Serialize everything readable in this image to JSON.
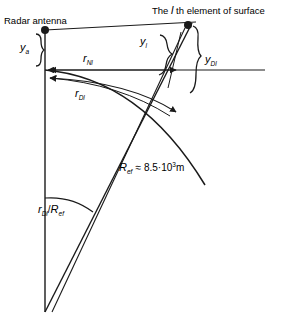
{
  "figure": {
    "type": "technical-geometry-diagram",
    "domain": "radar-propagation-earth-curvature",
    "background_color": "#ffffff",
    "stroke_color": "#1a1a1a",
    "width": 297,
    "height": 327
  },
  "labels": {
    "antenna_title": "Radar antenna",
    "element_title_prefix": "The ",
    "element_title_italic": "l",
    "element_title_suffix": " th element of surface",
    "antenna_height": {
      "base": "y",
      "subscript": "a"
    },
    "element_height": {
      "base": "y",
      "subscript": "l"
    },
    "element_drop": {
      "base": "y",
      "subscript": "Dl"
    },
    "range_direct": {
      "base": "r",
      "subscript": "Nl"
    },
    "range_curved": {
      "base": "r",
      "subscript": "Dl"
    },
    "earth_radius": {
      "base": "R",
      "subscript": "ef",
      "relation": "≈",
      "mantissa": "8.5",
      "separator": "·",
      "power_base": "10",
      "exponent": "3",
      "unit": "m",
      "full_text": "R_ef ≈ 8.5·10³m"
    },
    "central_angle": {
      "numerator_base": "r",
      "numerator_sub": "Dl",
      "slash": "/",
      "denominator_base": "R",
      "denominator_sub": "ef",
      "full_text": "r_Dl / R_ef"
    }
  },
  "geometry": {
    "antenna_point": {
      "x": 45,
      "y": 30
    },
    "element_point": {
      "x": 188,
      "y": 25
    },
    "earth_center": {
      "x": 45,
      "y": 312
    },
    "horizontal_reference_line": {
      "x1": 45,
      "y1": 70,
      "x2": 265,
      "y2": 70
    },
    "vertical_axis": {
      "x1": 45,
      "y1": 30,
      "x2": 45,
      "y2": 312
    }
  }
}
